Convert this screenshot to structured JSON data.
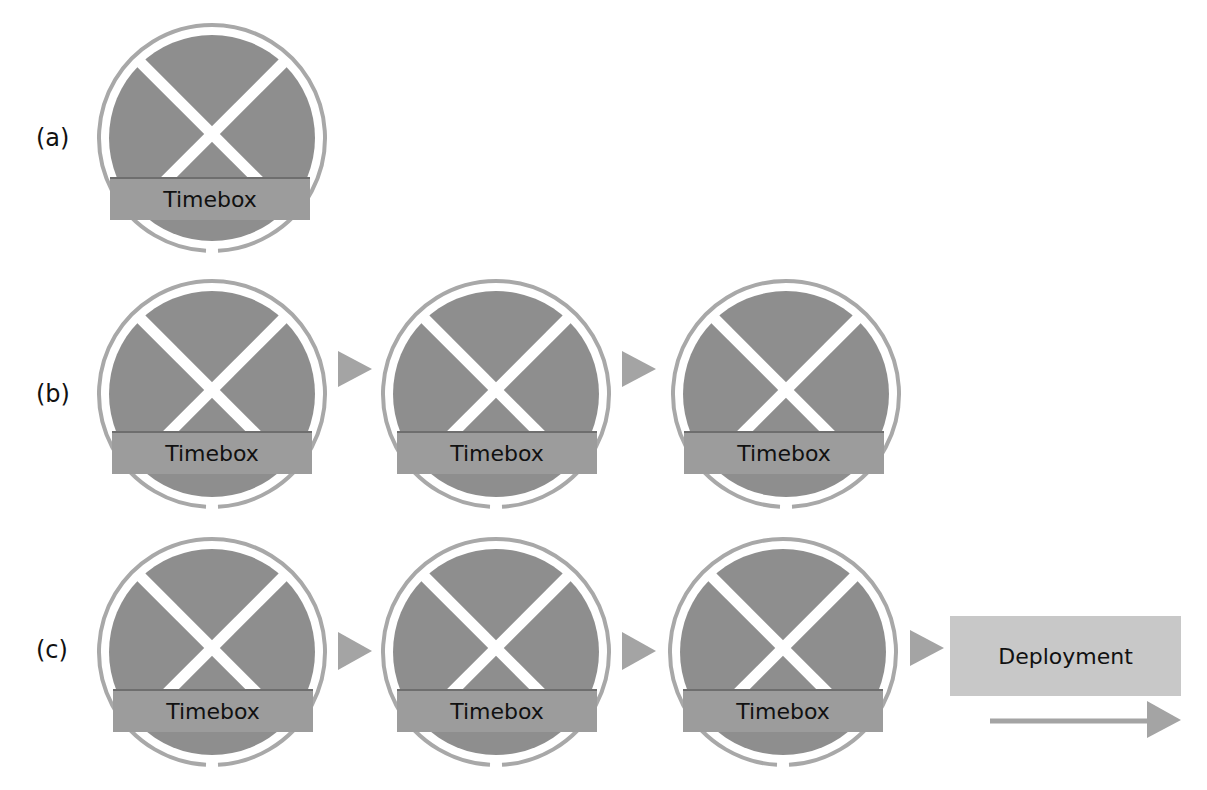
{
  "colors": {
    "disc": "#8e8e8e",
    "ring": "#a8a8a8",
    "band": "#9c9c9c",
    "band_top_line": "#6e6e6e",
    "arrow": "#a4a4a4",
    "deploy_box": "#c8c8c8",
    "text": "#111111"
  },
  "rows": [
    {
      "label": "(a)",
      "timeboxes": [
        "Timebox"
      ]
    },
    {
      "label": "(b)",
      "timeboxes": [
        "Timebox",
        "Timebox",
        "Timebox"
      ]
    },
    {
      "label": "(c)",
      "timeboxes": [
        "Timebox",
        "Timebox",
        "Timebox"
      ],
      "deployment": "Deployment"
    }
  ]
}
